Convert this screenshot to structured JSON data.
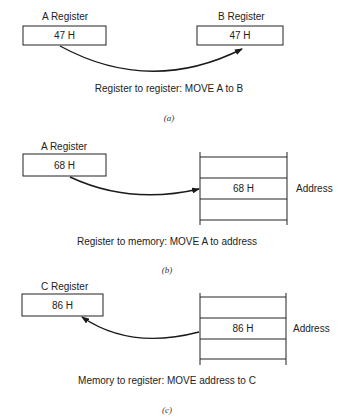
{
  "panels": [
    {
      "id": "a",
      "source": {
        "label": "A Register",
        "value": "47 H"
      },
      "target": {
        "label": "B Register",
        "value": "47 H"
      },
      "caption": "Register to register: MOVE A to B",
      "subfigure": "(a)"
    },
    {
      "id": "b",
      "source": {
        "label": "A Register",
        "value": "68 H"
      },
      "memory": {
        "cell_value": "68 H",
        "address_label": "Address"
      },
      "caption": "Register to memory: MOVE A to address",
      "subfigure": "(b)"
    },
    {
      "id": "c",
      "target": {
        "label": "C Register",
        "value": "86 H"
      },
      "memory": {
        "cell_value": "86 H",
        "address_label": "Address"
      },
      "caption": "Memory to register: MOVE address to C",
      "subfigure": "(c)"
    }
  ]
}
